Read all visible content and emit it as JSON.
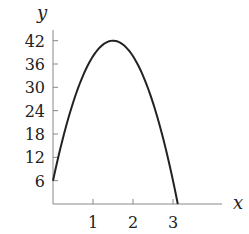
{
  "chart_data": {
    "type": "line",
    "title": "",
    "xlabel": "x",
    "ylabel": "y",
    "x_ticks": [
      1,
      2,
      3
    ],
    "y_ticks": [
      6,
      12,
      18,
      24,
      30,
      36,
      42
    ],
    "xlim": [
      0,
      3.7
    ],
    "ylim": [
      0,
      44
    ],
    "grid": false,
    "legend": null,
    "series": [
      {
        "name": "y = -16x^2 + 48x + 6",
        "color": "#222222",
        "x": [
          0,
          0.25,
          0.5,
          0.75,
          1.0,
          1.25,
          1.5,
          1.75,
          2.0,
          2.25,
          2.5,
          2.75,
          3.0,
          3.12
        ],
        "y": [
          6,
          17,
          26,
          33,
          38,
          41,
          42,
          41,
          38,
          33,
          26,
          17,
          6,
          0
        ]
      }
    ]
  },
  "labels": {
    "x_axis": "x",
    "y_axis": "y",
    "x_ticks": [
      "1",
      "2",
      "3"
    ],
    "y_ticks": [
      "6",
      "12",
      "18",
      "24",
      "30",
      "36",
      "42"
    ]
  }
}
